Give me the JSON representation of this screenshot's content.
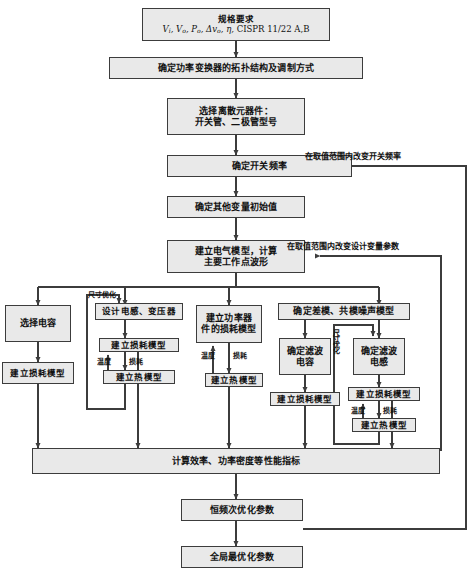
{
  "diagram": {
    "colors": {
      "node_fill": "#e9e9e9",
      "node_border": "#3c3c3c",
      "wire": "#3c3c3c",
      "text": "#111111",
      "background": "#ffffff"
    }
  },
  "nodes": {
    "spec": {
      "line1": "规格要求",
      "line2": "Vi, Vo, Po, Δvo, η, CISPR 11/22 A,B"
    },
    "topology": {
      "label": "确定功率变换器的拓扑结构及调制方式"
    },
    "discrete": {
      "line1": "选择离散元器件：",
      "line2": "开关管、二极管型号"
    },
    "switching_freq": {
      "label": "确定开关频率"
    },
    "other_vars": {
      "label": "确定其他变量初始值"
    },
    "electrical_model": {
      "line1": "建立电气模型，计算",
      "line2": "主要工作点波形"
    },
    "select_cap": {
      "label": "选择电容"
    },
    "cap_loss_model": {
      "label": "建立损耗模型"
    },
    "design_inductor": {
      "label": "设计电感、变压器"
    },
    "inductor_loss_model": {
      "label": "建立损耗模型"
    },
    "inductor_thermal_model": {
      "label": "建立热模型"
    },
    "device_loss_model": {
      "line1": "建立功率器",
      "line2": "件的损耗模型"
    },
    "device_thermal_model": {
      "label": "建立热模型"
    },
    "noise_model": {
      "label": "确定差模、共模噪声模型"
    },
    "filter_cap": {
      "line1": "确定滤波",
      "line2": "电容"
    },
    "filter_cap_loss_model": {
      "label": "建立损耗模型"
    },
    "filter_inductor": {
      "line1": "确定滤波",
      "line2": "电感"
    },
    "filter_inductor_loss_model": {
      "label": "建立损耗模型"
    },
    "filter_inductor_thermal_model": {
      "label": "建立热模型"
    },
    "performance": {
      "label": "计算效率、功率密度等性能指标"
    },
    "const_freq_subopt": {
      "label": "恒频次优化参数"
    },
    "global_opt": {
      "label": "全局最优化参数"
    }
  },
  "edge_labels": {
    "vary_switching_freq": "在取值范围内改变开关频率",
    "vary_design_vars": "在取值范围内改变设计变量参数",
    "size_opt_inductor": "尺寸优化",
    "size_opt_filter": "尺寸优化",
    "inductor_temp": "温度",
    "inductor_loss": "损耗",
    "device_temp": "温度",
    "device_loss": "损耗",
    "filter_temp": "温度",
    "filter_loss": "损耗"
  }
}
